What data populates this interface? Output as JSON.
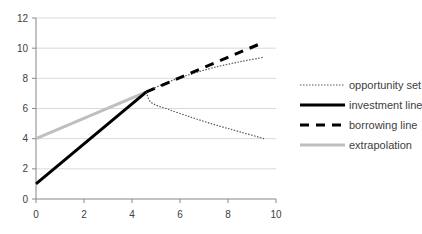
{
  "chart_data": {
    "type": "line",
    "title": "",
    "xlabel": "",
    "ylabel": "",
    "xlim": [
      0,
      10
    ],
    "ylim": [
      0,
      12
    ],
    "x_ticks": [
      "0",
      "2",
      "4",
      "6",
      "8",
      "10"
    ],
    "y_ticks": [
      "0",
      "2",
      "4",
      "6",
      "8",
      "10",
      "12"
    ],
    "grid": "horizontal",
    "legend_position": "right",
    "series": [
      {
        "name": "opportunity set",
        "style": "dotted",
        "color": "#595959",
        "points": [
          [
            4.6,
            7.1
          ],
          [
            5.5,
            7.75
          ],
          [
            6.5,
            8.3
          ],
          [
            7.5,
            8.75
          ],
          [
            8.5,
            9.1
          ],
          [
            9.5,
            9.4
          ]
        ],
        "lower_branch": [
          [
            4.6,
            7.1
          ],
          [
            4.8,
            6.4
          ],
          [
            5.5,
            5.95
          ],
          [
            6.5,
            5.4
          ],
          [
            7.5,
            4.9
          ],
          [
            8.5,
            4.45
          ],
          [
            9.5,
            4.0
          ]
        ]
      },
      {
        "name": "investment line",
        "style": "solid-thick",
        "color": "#000000",
        "points": [
          [
            0,
            1
          ],
          [
            4.6,
            7.1
          ]
        ]
      },
      {
        "name": "borrowing line",
        "style": "dashed",
        "color": "#000000",
        "points": [
          [
            4.6,
            7.1
          ],
          [
            9.5,
            10.4
          ]
        ]
      },
      {
        "name": "extrapolation",
        "style": "solid",
        "color": "#bfbfbf",
        "points": [
          [
            0,
            4
          ],
          [
            4.6,
            7.1
          ]
        ]
      }
    ]
  },
  "legend": {
    "items": [
      {
        "label": "opportunity set"
      },
      {
        "label": "investment line"
      },
      {
        "label": "borrowing line"
      },
      {
        "label": "extrapolation"
      }
    ]
  }
}
